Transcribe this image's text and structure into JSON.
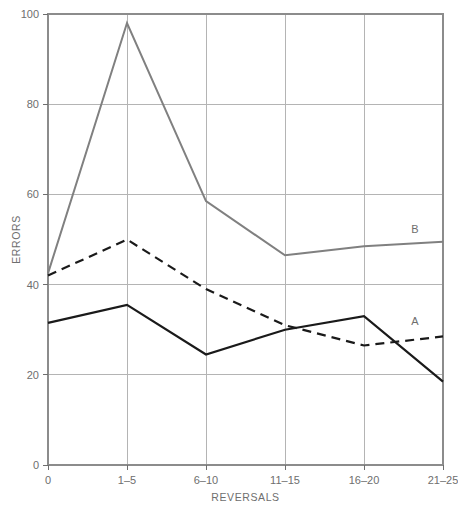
{
  "chart_data": {
    "type": "line",
    "title": "",
    "xlabel": "REVERSALS",
    "ylabel": "ERRORS",
    "categories": [
      "0",
      "1–5",
      "6–10",
      "11–15",
      "16–20",
      "21–25"
    ],
    "ylim": [
      0,
      100
    ],
    "yticks": [
      0,
      20,
      40,
      60,
      80,
      100
    ],
    "ytick_labels": [
      "0",
      "20",
      "40",
      "60",
      "80",
      "100"
    ],
    "grid": true,
    "legend_position": "inline-right",
    "series": [
      {
        "name": "B",
        "label": "B",
        "style": "solid",
        "color": "#808080",
        "width": 2.0,
        "values": [
          42.5,
          98,
          58.5,
          46.5,
          48.5,
          49.5
        ]
      },
      {
        "name": "A",
        "label": "A",
        "style": "dashed",
        "color": "#1a1a1a",
        "width": 2.2,
        "values": [
          42,
          50,
          39,
          31,
          26.5,
          28.5
        ]
      },
      {
        "name": "solid-black",
        "label": "",
        "style": "solid",
        "color": "#1a1a1a",
        "width": 2.2,
        "values": [
          31.5,
          35.5,
          24.5,
          30,
          33,
          18.5
        ]
      }
    ]
  },
  "labels": {
    "series_b": "B",
    "series_a": "A"
  }
}
